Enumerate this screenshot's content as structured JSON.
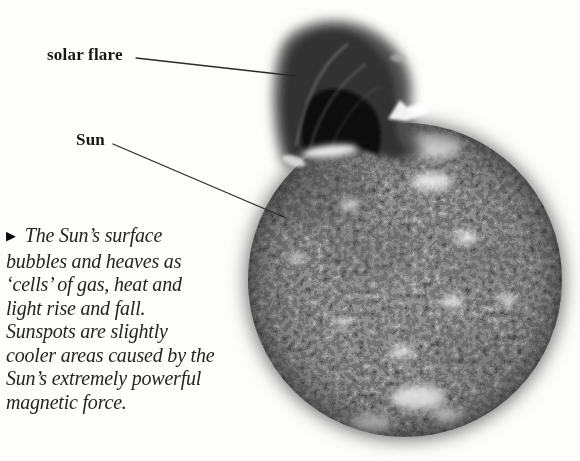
{
  "figure": {
    "image_alt": "Grayscale photograph of the Sun's mottled surface with a dark solar flare erupting from its upper left edge",
    "labels": [
      {
        "text": "solar flare"
      },
      {
        "text": "Sun"
      }
    ],
    "caption": {
      "marker": "▶",
      "lines": [
        "The Sun’s surface",
        "bubbles and heaves as",
        "‘cells’ of gas, heat and",
        "light rise and fall.",
        "Sunspots are slightly",
        "cooler areas caused by the",
        "Sun’s extremely powerful",
        "magnetic force."
      ]
    },
    "colors": {
      "page_background": "#fdfdfc",
      "text": "#242424",
      "sun_surface_gray": "#8a8a8a",
      "halo_gray": "#6e6e6e",
      "flare_outer": "#4d4d4d",
      "flare_core": "#0d0d0d",
      "pointer_line": "#2a2a2a"
    }
  }
}
